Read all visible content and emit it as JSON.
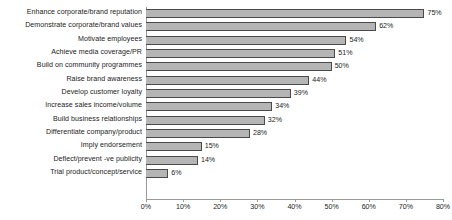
{
  "chart_data": {
    "type": "bar",
    "orientation": "horizontal",
    "title": "",
    "subtitle": "",
    "xlabel": "",
    "ylabel": "",
    "xlim": [
      0,
      80
    ],
    "grid": false,
    "legend": null,
    "value_suffix": "%",
    "categories": [
      "Enhance corporate/brand reputation",
      "Demonstrate corporate/brand values",
      "Motivate employees",
      "Achieve media coverage/PR",
      "Build on community programmes",
      "Raise brand awareness",
      "Develop customer loyalty",
      "Increase sales income/volume",
      "Build business relationships",
      "Differentiate company/product",
      "Imply endorsement",
      "Deflect/prevent -ve publicity",
      "Trial product/concept/service"
    ],
    "values": [
      75,
      62,
      54,
      51,
      50,
      44,
      39,
      34,
      32,
      28,
      15,
      14,
      6
    ],
    "data_labels": [
      "75%",
      "62%",
      "54%",
      "51%",
      "50%",
      "44%",
      "39%",
      "34%",
      "32%",
      "28%",
      "15%",
      "14%",
      "6%"
    ],
    "xticks": [
      0,
      10,
      20,
      30,
      40,
      50,
      60,
      70,
      80
    ],
    "xtick_labels": [
      "0%",
      "10%",
      "20%",
      "30%",
      "40%",
      "50%",
      "60%",
      "70%",
      "80%"
    ],
    "colors": {
      "bar_fill": "#b5b5b5",
      "bar_border": "#4a4a4a",
      "axis": "#9a9a9a",
      "text": "#232323",
      "background": "#ffffff"
    }
  }
}
